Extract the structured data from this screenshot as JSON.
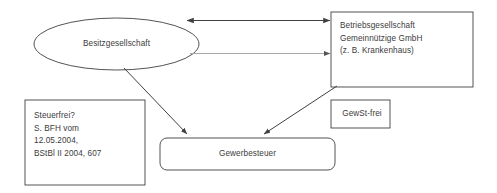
{
  "diagram": {
    "background_color": "#ffffff",
    "stroke_color": "#404040",
    "muted_stroke_color": "#a8a8a8",
    "text_color": "#3b3b3b",
    "nodes": {
      "besitzgesellschaft": {
        "shape": "ellipse",
        "label": "Besitzgesellschaft"
      },
      "betriebsgesellschaft": {
        "shape": "rectangle",
        "line1": "Betriebsgesellschaft",
        "line2": "Gemeinnützige GmbH",
        "line3": "(z. B. Krankenhaus)",
        "label": "Betriebsgesellschaft\nGemeinnützige GmbH\n(z. B. Krankenhaus)"
      },
      "steuerfrei_note": {
        "shape": "rectangle",
        "line1": "Steuerfrei?",
        "line2": "S. BFH vom",
        "line3": "12.05.2004,",
        "line4": "BStBl II 2004, 607",
        "label": "Steuerfrei?\nS. BFH vom\n12.05.2004,\nBStBl II 2004, 607"
      },
      "gewst_frei": {
        "shape": "rectangle",
        "label": "GewSt-frei"
      },
      "gewerbesteuer": {
        "shape": "rounded-rectangle",
        "label": "Gewerbesteuer"
      }
    },
    "connectors": [
      {
        "name": "besitz-betrieb-double",
        "from": "besitzgesellschaft",
        "to": "betriebsgesellschaft",
        "style": "solid",
        "arrowheads": "both",
        "color": "#404040"
      },
      {
        "name": "besitz-betrieb-single",
        "from": "besitzgesellschaft",
        "to": "betriebsgesellschaft",
        "style": "solid-light",
        "arrowheads": "end",
        "color": "#a8a8a8"
      },
      {
        "name": "besitz-gewerbesteuer",
        "from": "besitzgesellschaft",
        "to": "gewerbesteuer",
        "style": "solid",
        "arrowheads": "end",
        "color": "#404040"
      },
      {
        "name": "betrieb-gewerbesteuer",
        "from": "betriebsgesellschaft",
        "to": "gewerbesteuer",
        "style": "solid",
        "arrowheads": "end",
        "color": "#404040"
      }
    ]
  }
}
